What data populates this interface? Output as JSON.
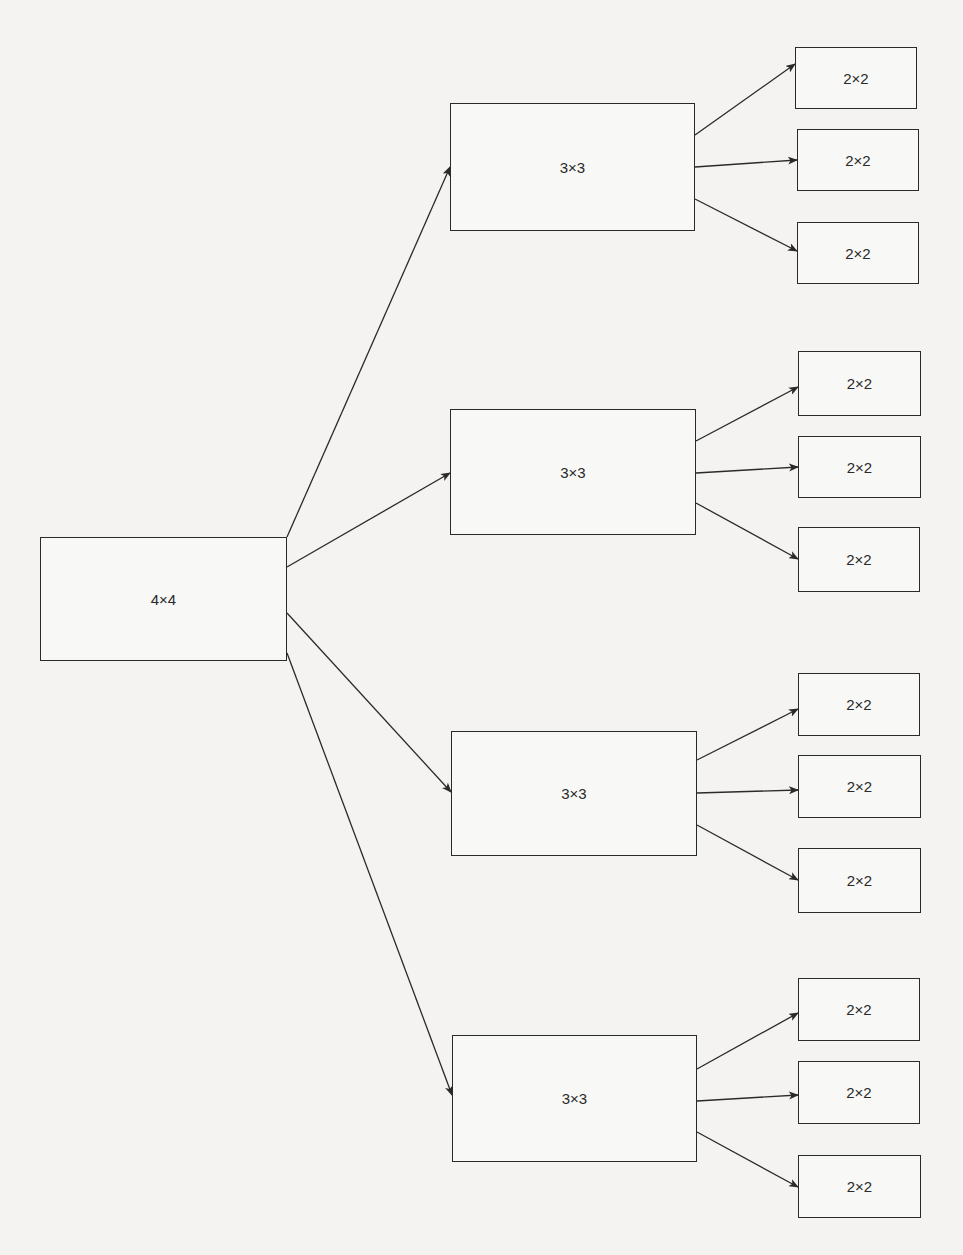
{
  "diagram": {
    "type": "tree",
    "direction": "left-to-right",
    "root": {
      "id": "n0",
      "label": "4×4",
      "x": 40,
      "y": 537,
      "w": 247,
      "h": 124
    },
    "level1": [
      {
        "id": "n1",
        "label": "3×3",
        "x": 450,
        "y": 103,
        "w": 245,
        "h": 128
      },
      {
        "id": "n2",
        "label": "3×3",
        "x": 450,
        "y": 409,
        "w": 246,
        "h": 126
      },
      {
        "id": "n3",
        "label": "3×3",
        "x": 451,
        "y": 731,
        "w": 246,
        "h": 125
      },
      {
        "id": "n4",
        "label": "3×3",
        "x": 452,
        "y": 1035,
        "w": 245,
        "h": 127
      }
    ],
    "level2": [
      {
        "id": "n1a",
        "parent": "n1",
        "label": "2×2",
        "x": 795,
        "y": 47,
        "w": 122,
        "h": 62
      },
      {
        "id": "n1b",
        "parent": "n1",
        "label": "2×2",
        "x": 797,
        "y": 129,
        "w": 122,
        "h": 62
      },
      {
        "id": "n1c",
        "parent": "n1",
        "label": "2×2",
        "x": 797,
        "y": 222,
        "w": 122,
        "h": 62
      },
      {
        "id": "n2a",
        "parent": "n2",
        "label": "2×2",
        "x": 798,
        "y": 351,
        "w": 123,
        "h": 65
      },
      {
        "id": "n2b",
        "parent": "n2",
        "label": "2×2",
        "x": 798,
        "y": 436,
        "w": 123,
        "h": 62
      },
      {
        "id": "n2c",
        "parent": "n2",
        "label": "2×2",
        "x": 798,
        "y": 527,
        "w": 122,
        "h": 65
      },
      {
        "id": "n3a",
        "parent": "n3",
        "label": "2×2",
        "x": 798,
        "y": 673,
        "w": 122,
        "h": 63
      },
      {
        "id": "n3b",
        "parent": "n3",
        "label": "2×2",
        "x": 798,
        "y": 755,
        "w": 123,
        "h": 63
      },
      {
        "id": "n3c",
        "parent": "n3",
        "label": "2×2",
        "x": 798,
        "y": 848,
        "w": 123,
        "h": 65
      },
      {
        "id": "n4a",
        "parent": "n4",
        "label": "2×2",
        "x": 798,
        "y": 978,
        "w": 122,
        "h": 63
      },
      {
        "id": "n4b",
        "parent": "n4",
        "label": "2×2",
        "x": 798,
        "y": 1061,
        "w": 122,
        "h": 63
      },
      {
        "id": "n4c",
        "parent": "n4",
        "label": "2×2",
        "x": 798,
        "y": 1155,
        "w": 123,
        "h": 63
      }
    ],
    "edges": [
      {
        "from": "n0",
        "to": "n1",
        "x1": 287,
        "y1": 537,
        "x2": 450,
        "y2": 167
      },
      {
        "from": "n0",
        "to": "n2",
        "x1": 287,
        "y1": 567,
        "x2": 450,
        "y2": 473
      },
      {
        "from": "n0",
        "to": "n3",
        "x1": 287,
        "y1": 613,
        "x2": 451,
        "y2": 792
      },
      {
        "from": "n0",
        "to": "n4",
        "x1": 287,
        "y1": 653,
        "x2": 452,
        "y2": 1095
      },
      {
        "from": "n1",
        "to": "n1a",
        "x1": 695,
        "y1": 135,
        "x2": 795,
        "y2": 64
      },
      {
        "from": "n1",
        "to": "n1b",
        "x1": 695,
        "y1": 167,
        "x2": 797,
        "y2": 160
      },
      {
        "from": "n1",
        "to": "n1c",
        "x1": 695,
        "y1": 199,
        "x2": 797,
        "y2": 251
      },
      {
        "from": "n2",
        "to": "n2a",
        "x1": 696,
        "y1": 441,
        "x2": 798,
        "y2": 387
      },
      {
        "from": "n2",
        "to": "n2b",
        "x1": 696,
        "y1": 473,
        "x2": 798,
        "y2": 467
      },
      {
        "from": "n2",
        "to": "n2c",
        "x1": 696,
        "y1": 503,
        "x2": 798,
        "y2": 559
      },
      {
        "from": "n3",
        "to": "n3a",
        "x1": 697,
        "y1": 760,
        "x2": 798,
        "y2": 709
      },
      {
        "from": "n3",
        "to": "n3b",
        "x1": 697,
        "y1": 793,
        "x2": 798,
        "y2": 790
      },
      {
        "from": "n3",
        "to": "n3c",
        "x1": 697,
        "y1": 825,
        "x2": 798,
        "y2": 880
      },
      {
        "from": "n4",
        "to": "n4a",
        "x1": 697,
        "y1": 1069,
        "x2": 798,
        "y2": 1013
      },
      {
        "from": "n4",
        "to": "n4b",
        "x1": 697,
        "y1": 1101,
        "x2": 798,
        "y2": 1095
      },
      {
        "from": "n4",
        "to": "n4c",
        "x1": 697,
        "y1": 1132,
        "x2": 798,
        "y2": 1187
      }
    ]
  },
  "colors": {
    "background": "#f4f3f1",
    "box_fill": "#f8f8f6",
    "stroke": "#2a2a2a",
    "text": "#2a2a2a"
  }
}
